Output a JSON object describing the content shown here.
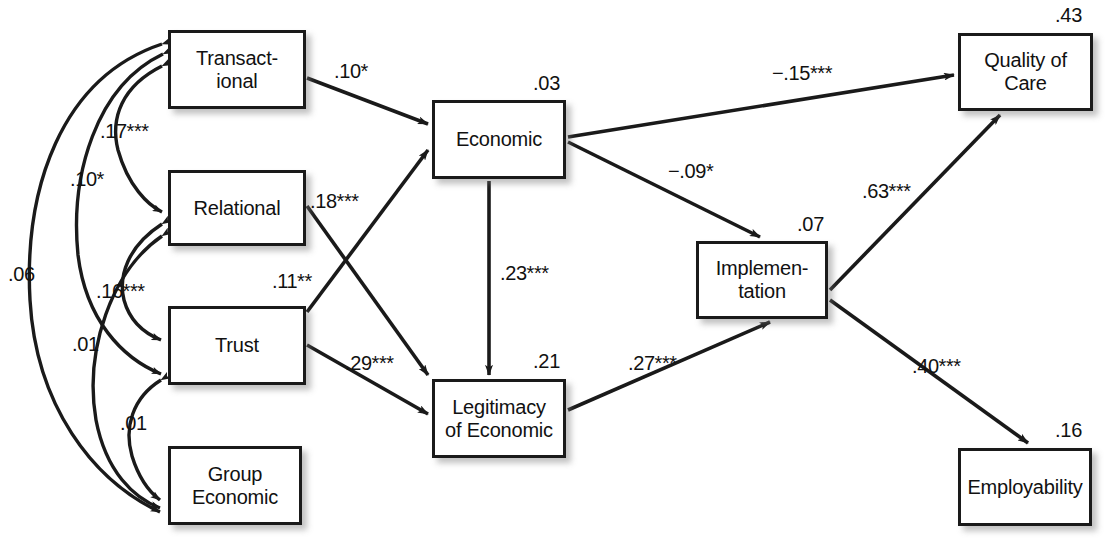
{
  "figure": {
    "type": "path-diagram"
  },
  "nodes": [
    {
      "id": "transactional",
      "label": "Transact-\nional",
      "r2": ".03_unused",
      "x": 168,
      "y": 30,
      "w": 138,
      "h": 79
    },
    {
      "id": "relational",
      "label": "Relational",
      "x": 168,
      "y": 170,
      "w": 138,
      "h": 76
    },
    {
      "id": "trust",
      "label": "Trust",
      "x": 168,
      "y": 306,
      "w": 138,
      "h": 79
    },
    {
      "id": "group_economic",
      "label": "Group\nEconomic",
      "x": 168,
      "y": 446,
      "w": 134,
      "h": 79
    },
    {
      "id": "economic",
      "label": "Economic",
      "x": 432,
      "y": 100,
      "w": 134,
      "h": 79
    },
    {
      "id": "legitimacy",
      "label": "Legitimacy\nof Economic",
      "x": 432,
      "y": 379,
      "w": 134,
      "h": 79
    },
    {
      "id": "implementation",
      "label": "Implemen-\ntation",
      "x": 696,
      "y": 241,
      "w": 132,
      "h": 78
    },
    {
      "id": "quality",
      "label": "Quality of\nCare",
      "x": 958,
      "y": 33,
      "w": 135,
      "h": 78
    },
    {
      "id": "employability",
      "label": "Employability",
      "x": 958,
      "y": 448,
      "w": 134,
      "h": 78
    }
  ],
  "r2_values": [
    {
      "id": "r2-economic",
      "text": ".03",
      "x": 533,
      "y": 72
    },
    {
      "id": "r2-quality",
      "text": ".43",
      "x": 1055,
      "y": 4
    },
    {
      "id": "r2-implementation",
      "text": ".07",
      "x": 797,
      "y": 213
    },
    {
      "id": "r2-legitimacy",
      "text": ".21",
      "x": 533,
      "y": 350
    },
    {
      "id": "r2-employability",
      "text": ".16",
      "x": 1055,
      "y": 419
    }
  ],
  "paths": [
    {
      "id": "transactional-to-economic",
      "from": "transactional",
      "to": "economic",
      "coef": ".10*",
      "lx": 334,
      "ly": 60
    },
    {
      "id": "relational-to-legitimacy",
      "from": "relational",
      "to": "legitimacy",
      "coef": ".18***",
      "lx": 310,
      "ly": 190
    },
    {
      "id": "trust-to-economic",
      "from": "trust",
      "to": "economic",
      "coef": ".11**",
      "lx": 272,
      "ly": 270
    },
    {
      "id": "trust-to-legitimacy",
      "from": "trust",
      "to": "legitimacy",
      "coef": ".29***",
      "lx": 345,
      "ly": 352
    },
    {
      "id": "economic-to-legitimacy",
      "from": "economic",
      "to": "legitimacy",
      "coef": ".23***",
      "lx": 500,
      "ly": 262
    },
    {
      "id": "economic-to-quality",
      "from": "economic",
      "to": "quality",
      "coef": "−.15***",
      "lx": 772,
      "ly": 62
    },
    {
      "id": "economic-to-implementation",
      "from": "economic",
      "to": "implementation",
      "coef": "−.09*",
      "lx": 668,
      "ly": 160
    },
    {
      "id": "legitimacy-to-implementation",
      "from": "legitimacy",
      "to": "implementation",
      "coef": ".27***",
      "lx": 628,
      "ly": 352
    },
    {
      "id": "implementation-to-quality",
      "from": "implementation",
      "to": "quality",
      "coef": ".63***",
      "lx": 862,
      "ly": 180
    },
    {
      "id": "implementation-to-employability",
      "from": "implementation",
      "to": "employability",
      "coef": ".40***",
      "lx": 912,
      "ly": 355
    }
  ],
  "correlations": [
    {
      "id": "corr-transactional-group",
      "between": [
        "transactional",
        "group_economic"
      ],
      "coef": ".06",
      "lx": 8,
      "ly": 263
    },
    {
      "id": "corr-transactional-trust",
      "between": [
        "transactional",
        "trust"
      ],
      "coef": ".10*",
      "lx": 70,
      "ly": 168
    },
    {
      "id": "corr-transactional-relational",
      "between": [
        "transactional",
        "relational"
      ],
      "coef": ".17***",
      "lx": 100,
      "ly": 120
    },
    {
      "id": "corr-relational-trust",
      "between": [
        "relational",
        "trust"
      ],
      "coef": ".16***",
      "lx": 96,
      "ly": 280
    },
    {
      "id": "corr-relational-group",
      "between": [
        "relational",
        "group_economic"
      ],
      "coef": ".01",
      "lx": 72,
      "ly": 333
    },
    {
      "id": "corr-trust-group",
      "between": [
        "trust",
        "group_economic"
      ],
      "coef": ".01",
      "lx": 120,
      "ly": 412
    }
  ],
  "colors": {
    "stroke": "#1a1a1a",
    "box_fill": "#ffffff",
    "text": "#111111",
    "background": "#ffffff"
  }
}
